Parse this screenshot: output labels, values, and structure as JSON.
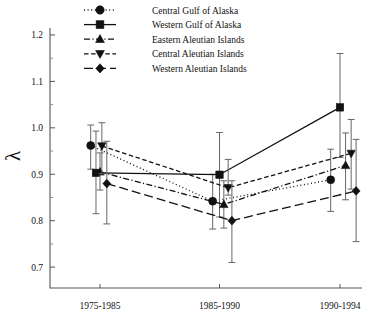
{
  "chart_data": {
    "type": "line",
    "title": "",
    "xlabel": "",
    "ylabel": "λ",
    "categories": [
      "1975-1985",
      "1985-1990",
      "1990-1994"
    ],
    "ylim": [
      0.655,
      1.215
    ],
    "ytick_labels": [
      "0.7",
      "0.8",
      "0.9",
      "1.0",
      "1.1",
      "1.2"
    ],
    "ytick_values": [
      0.7,
      0.8,
      0.9,
      1.0,
      1.1,
      1.2
    ],
    "yminor_values": [
      0.75,
      0.85,
      0.95,
      1.05,
      1.15
    ],
    "grid": false,
    "legend_position": "top-center",
    "error_bars": "vertical",
    "series": [
      {
        "name": "Central Gulf of Alaska",
        "marker": "circle",
        "linestyle": "dotted",
        "color": "#111111",
        "x_offset": [
          -0.3,
          -0.22,
          -0.3
        ],
        "values": [
          0.962,
          0.842,
          0.888
        ],
        "err_low": [
          0.911,
          0.782,
          0.82
        ],
        "err_high": [
          1.006,
          0.9,
          0.954
        ]
      },
      {
        "name": "Western Gulf of Alaska",
        "marker": "square",
        "linestyle": "solid",
        "color": "#111111",
        "x_offset": [
          -0.13,
          0.0,
          0.0
        ],
        "values": [
          0.903,
          0.899,
          1.044
        ],
        "err_low": [
          0.815,
          0.808,
          0.936
        ],
        "err_high": [
          0.993,
          0.99,
          1.16
        ]
      },
      {
        "name": "Eastern Aleutian Islands",
        "marker": "triangle-up",
        "linestyle": "dashdot",
        "color": "#111111",
        "x_offset": [
          0.0,
          0.14,
          0.18
        ],
        "values": [
          0.905,
          0.835,
          0.919
        ],
        "err_low": [
          0.866,
          0.784,
          0.845
        ],
        "err_high": [
          0.946,
          0.886,
          0.989
        ]
      },
      {
        "name": "Central Aleutian Islands",
        "marker": "triangle-down",
        "linestyle": "dashed",
        "color": "#111111",
        "x_offset": [
          0.06,
          0.28,
          0.36
        ],
        "values": [
          0.961,
          0.871,
          0.945
        ],
        "err_low": [
          0.901,
          0.855,
          0.868
        ],
        "err_high": [
          1.011,
          0.932,
          1.018
        ]
      },
      {
        "name": "Western Aleutian Islands",
        "marker": "diamond",
        "linestyle": "longdash",
        "color": "#111111",
        "x_offset": [
          0.22,
          0.4,
          0.52
        ],
        "values": [
          0.88,
          0.8,
          0.864
        ],
        "err_low": [
          0.793,
          0.71,
          0.755
        ],
        "err_high": [
          0.971,
          0.886,
          0.975
        ]
      }
    ]
  },
  "legend": {
    "items": [
      {
        "label": "Central Gulf of Alaska",
        "marker": "circle",
        "linestyle": "dotted"
      },
      {
        "label": "Western Gulf of Alaska",
        "marker": "square",
        "linestyle": "solid"
      },
      {
        "label": "Eastern Aleutian Islands",
        "marker": "triangle-up",
        "linestyle": "dashdot"
      },
      {
        "label": "Central Aleutian Islands",
        "marker": "triangle-down",
        "linestyle": "dashed"
      },
      {
        "label": "Western Aleutian Islands",
        "marker": "diamond",
        "linestyle": "longdash"
      }
    ]
  }
}
